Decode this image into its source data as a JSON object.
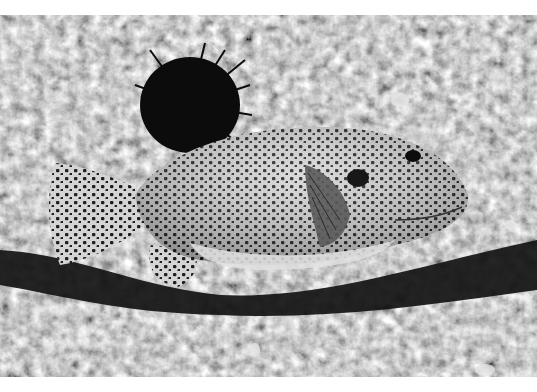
{
  "image": {
    "subject": "spotted pufferfish resting on a reef ledge",
    "alt": "Black-and-white underwater photo of a spotted pufferfish beneath a rocky overhang with a dark sea urchin behind it",
    "palette": {
      "background": "#ffffff",
      "rock_light": "#a8a8a8",
      "rock_mid": "#7a7a7a",
      "shadow": "#151515",
      "fish_body": "#d6d6d6",
      "fish_spots": "#1e1e1e",
      "urchin": "#0c0c0c"
    },
    "elements": [
      "reef-rock-top",
      "sea-urchin",
      "pufferfish",
      "shadow-crevice",
      "reef-rock-bottom"
    ]
  }
}
